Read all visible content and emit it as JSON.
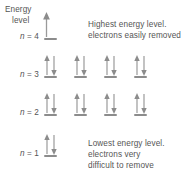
{
  "figure": {
    "type": "energy-level-diagram",
    "background": "#ffffff",
    "ink_color": "#555555",
    "line_color": "#8c8c8c"
  },
  "axis": {
    "label_line1": "Energy",
    "label_line2": "level",
    "direction": "up",
    "arrow_icon": "up-arrow-icon"
  },
  "levels": [
    {
      "id": "n4",
      "label_prefix": "n",
      "label_equals": "=",
      "label_value": "4",
      "label_text": "n = 4",
      "orbital_count": 1,
      "electrons_per_orbital": [
        0
      ],
      "y": 38
    },
    {
      "id": "n3",
      "label_prefix": "n",
      "label_equals": "=",
      "label_value": "3",
      "label_text": "n = 3",
      "orbital_count": 4,
      "electrons_per_orbital": [
        2,
        2,
        2,
        2
      ],
      "y": 76
    },
    {
      "id": "n2",
      "label_prefix": "n",
      "label_equals": "=",
      "label_value": "2",
      "label_text": "n = 2",
      "orbital_count": 4,
      "electrons_per_orbital": [
        2,
        2,
        2,
        2
      ],
      "y": 114
    },
    {
      "id": "n1",
      "label_prefix": "n",
      "label_equals": "=",
      "label_value": "1",
      "label_text": "n = 1",
      "orbital_count": 1,
      "electrons_per_orbital": [
        2
      ],
      "y": 155
    }
  ],
  "notes": {
    "top": {
      "line1": "Highest energy level.",
      "line2": "electrons easily removed"
    },
    "bottom": {
      "line1": "Lowest energy level.",
      "line2": "electrons very",
      "line3": "difficult to remove"
    }
  },
  "chart_data": {
    "type": "diagram",
    "categories": [
      "n = 1",
      "n = 2",
      "n = 3",
      "n = 4"
    ],
    "values": [
      2,
      8,
      8,
      0
    ],
    "series": [
      {
        "name": "orbitals",
        "values": [
          1,
          4,
          4,
          1
        ]
      },
      {
        "name": "electrons",
        "values": [
          2,
          8,
          8,
          0
        ]
      }
    ],
    "annotations": [
      "Highest energy level. electrons easily removed",
      "Lowest energy level. electrons very difficult to remove"
    ],
    "ylabel": "Energy level",
    "xlabel": ""
  }
}
